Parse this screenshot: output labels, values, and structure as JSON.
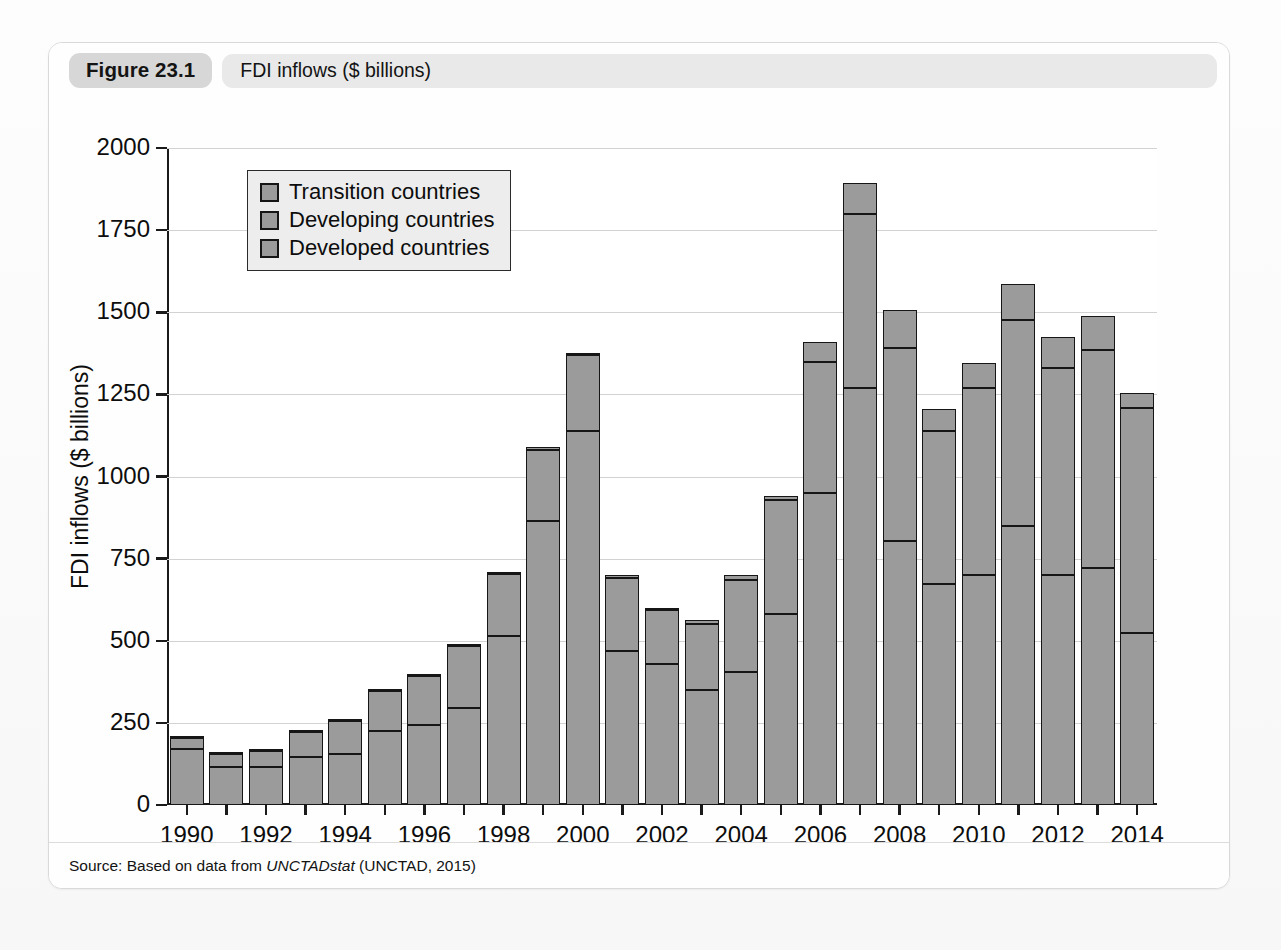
{
  "figure": {
    "tag": "Figure 23.1",
    "title": "FDI inflows ($ billions)",
    "source_prefix": "Source: Based on data from ",
    "source_italic": "UNCTADstat",
    "source_suffix": " (UNCTAD, 2015)"
  },
  "colors": {
    "bar_fill": "#9b9b9b",
    "bar_stroke": "#161616",
    "gridline": "#d2d2d2",
    "axis": "#1a1a1a",
    "legend_bg": "#ededed",
    "tag_bg": "#d7d7d7",
    "title_bg": "#e9e9e9",
    "card_border": "#d9d9d9"
  },
  "chart_data": {
    "type": "bar",
    "stacked": true,
    "title": "FDI inflows ($ billions)",
    "xlabel": "",
    "ylabel": "FDI inflows ($ billions)",
    "ylim": [
      0,
      2000
    ],
    "yticks": [
      0,
      250,
      500,
      750,
      1000,
      1250,
      1500,
      1750,
      2000
    ],
    "ytick_labels": [
      "0",
      "250",
      "500",
      "750",
      "1000",
      "1250",
      "1500",
      "1750",
      "2000"
    ],
    "grid": true,
    "legend_position": "upper left",
    "categories": [
      1990,
      1991,
      1992,
      1993,
      1994,
      1995,
      1996,
      1997,
      1998,
      1999,
      2000,
      2001,
      2002,
      2003,
      2004,
      2005,
      2006,
      2007,
      2008,
      2009,
      2010,
      2011,
      2012,
      2013,
      2014
    ],
    "xtick_labels": [
      "1990",
      "1992",
      "1994",
      "1996",
      "1998",
      "2000",
      "2002",
      "2004",
      "2006",
      "2008",
      "2010",
      "2012",
      "2014"
    ],
    "xtick_values": [
      1990,
      1992,
      1994,
      1996,
      1998,
      2000,
      2002,
      2004,
      2006,
      2008,
      2010,
      2012,
      2014
    ],
    "series": [
      {
        "name": "Developed countries",
        "values": [
          170,
          115,
          115,
          145,
          155,
          225,
          245,
          295,
          515,
          865,
          1140,
          470,
          430,
          350,
          405,
          580,
          950,
          1270,
          805,
          672,
          700,
          850,
          700,
          720,
          525
        ]
      },
      {
        "name": "Developing countries",
        "values": [
          35,
          40,
          50,
          78,
          100,
          122,
          147,
          188,
          187,
          215,
          230,
          222,
          164,
          202,
          280,
          350,
          400,
          530,
          585,
          468,
          570,
          625,
          630,
          665,
          685
        ]
      },
      {
        "name": "Transition countries",
        "values": [
          0,
          0,
          2,
          4,
          5,
          3,
          3,
          4,
          4,
          9,
          7,
          8,
          7,
          11,
          15,
          10,
          60,
          92,
          118,
          65,
          75,
          110,
          95,
          105,
          45
        ]
      }
    ],
    "totals": [
      205,
      155,
      167,
      227,
      260,
      350,
      395,
      487,
      706,
      1089,
      1377,
      700,
      601,
      563,
      700,
      940,
      1410,
      1892,
      1508,
      1205,
      1345,
      1585,
      1425,
      1490,
      1255
    ],
    "units": "US$ billions"
  },
  "legend": {
    "entries": [
      {
        "label": "Transition countries"
      },
      {
        "label": "Developing countries"
      },
      {
        "label": "Developed countries"
      }
    ]
  }
}
